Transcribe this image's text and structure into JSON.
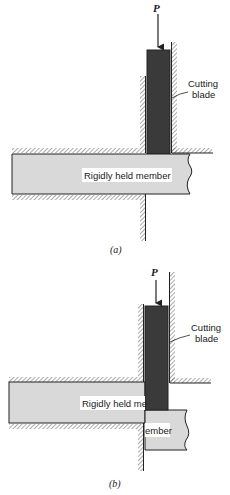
{
  "figure_a": {
    "caption": "(a)",
    "force_label": "P",
    "blade_label_line1": "Cutting",
    "blade_label_line2": "blade",
    "member_label": "Rigidly held member"
  },
  "figure_b": {
    "caption": "(b)",
    "force_label": "P",
    "blade_label_line1": "Cutting",
    "blade_label_line2": "blade",
    "member_label_left": "Rigidly held me",
    "member_label_right": "ember"
  },
  "colors": {
    "member_fill": "#d9d9d9",
    "blade_fill": "#3a3a3a",
    "hatch": "#555555",
    "line": "#222222"
  }
}
